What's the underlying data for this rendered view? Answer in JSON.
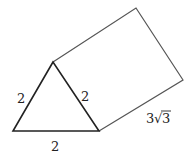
{
  "diagram": {
    "type": "triangular-prism",
    "colors": {
      "triangle_stroke": "#222222",
      "prism_stroke": "#555555",
      "text": "#222222"
    },
    "vertices": {
      "apex": [
        53,
        62
      ],
      "bottom_left": [
        13,
        131
      ],
      "bottom_right": [
        99,
        131
      ],
      "top_back": [
        136,
        8
      ],
      "right_back": [
        183,
        80
      ]
    },
    "labels": {
      "left_side": "2",
      "right_side": "2",
      "base": "2",
      "length": "3",
      "length_radical": "√",
      "length_radicand": "3"
    }
  }
}
